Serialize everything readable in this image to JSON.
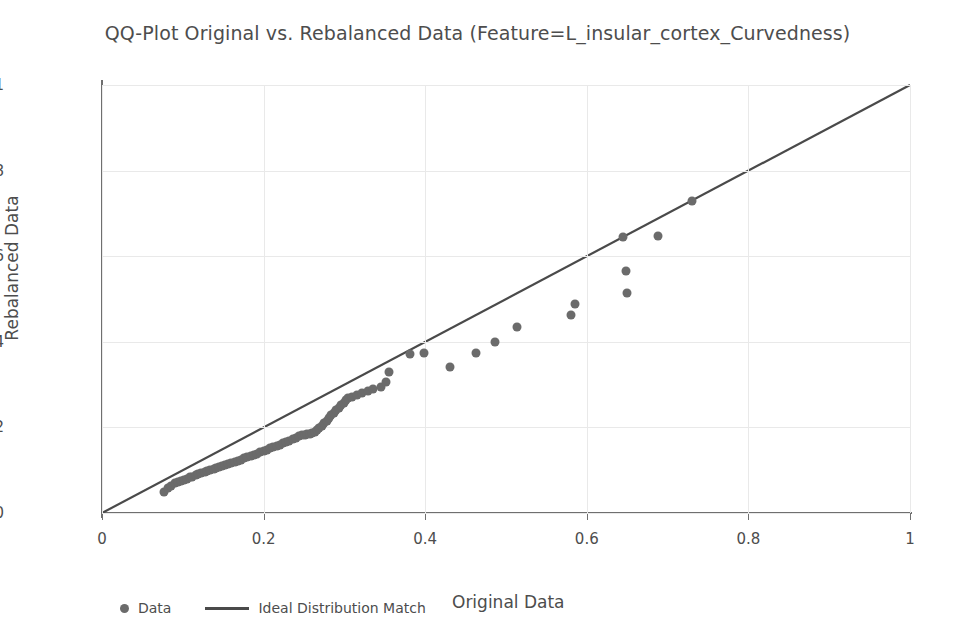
{
  "chart_data": {
    "type": "scatter",
    "title": "QQ-Plot Original vs. Rebalanced Data (Feature=L_insular_cortex_Curvedness)",
    "xlabel": "Original Data",
    "ylabel": "Rebalanced Data",
    "xlim": [
      0,
      1
    ],
    "ylim": [
      0,
      1
    ],
    "grid": true,
    "legend_position": "below-left",
    "xticks": [
      "0",
      "0.2",
      "0.4",
      "0.6",
      "0.8",
      "1"
    ],
    "xtick_values": [
      0,
      0.2,
      0.4,
      0.6,
      0.8,
      1
    ],
    "yticks": [
      "0",
      "0.2",
      "0.4",
      "0.6",
      "0.8",
      "1"
    ],
    "ytick_values": [
      0,
      0.2,
      0.4,
      0.6,
      0.8,
      1
    ],
    "series": [
      {
        "name": "Data",
        "type": "scatter",
        "color": "#6b6b6b",
        "marker": "circle",
        "points": [
          [
            0.077,
            0.05
          ],
          [
            0.082,
            0.058
          ],
          [
            0.086,
            0.064
          ],
          [
            0.09,
            0.069
          ],
          [
            0.094,
            0.072
          ],
          [
            0.098,
            0.075
          ],
          [
            0.101,
            0.078
          ],
          [
            0.105,
            0.08
          ],
          [
            0.109,
            0.083
          ],
          [
            0.112,
            0.085
          ],
          [
            0.116,
            0.088
          ],
          [
            0.119,
            0.09
          ],
          [
            0.123,
            0.093
          ],
          [
            0.127,
            0.095
          ],
          [
            0.13,
            0.098
          ],
          [
            0.134,
            0.1
          ],
          [
            0.138,
            0.103
          ],
          [
            0.141,
            0.105
          ],
          [
            0.145,
            0.108
          ],
          [
            0.149,
            0.11
          ],
          [
            0.152,
            0.112
          ],
          [
            0.156,
            0.115
          ],
          [
            0.16,
            0.117
          ],
          [
            0.164,
            0.12
          ],
          [
            0.168,
            0.122
          ],
          [
            0.172,
            0.125
          ],
          [
            0.176,
            0.128
          ],
          [
            0.18,
            0.13
          ],
          [
            0.184,
            0.133
          ],
          [
            0.188,
            0.136
          ],
          [
            0.192,
            0.139
          ],
          [
            0.196,
            0.142
          ],
          [
            0.2,
            0.145
          ],
          [
            0.204,
            0.148
          ],
          [
            0.208,
            0.151
          ],
          [
            0.212,
            0.154
          ],
          [
            0.216,
            0.157
          ],
          [
            0.22,
            0.16
          ],
          [
            0.224,
            0.163
          ],
          [
            0.228,
            0.166
          ],
          [
            0.232,
            0.169
          ],
          [
            0.236,
            0.172
          ],
          [
            0.24,
            0.176
          ],
          [
            0.244,
            0.179
          ],
          [
            0.248,
            0.182
          ],
          [
            0.251,
            0.183
          ],
          [
            0.254,
            0.184
          ],
          [
            0.257,
            0.185
          ],
          [
            0.26,
            0.187
          ],
          [
            0.263,
            0.19
          ],
          [
            0.266,
            0.194
          ],
          [
            0.269,
            0.199
          ],
          [
            0.272,
            0.204
          ],
          [
            0.275,
            0.21
          ],
          [
            0.278,
            0.216
          ],
          [
            0.281,
            0.222
          ],
          [
            0.284,
            0.228
          ],
          [
            0.287,
            0.234
          ],
          [
            0.29,
            0.24
          ],
          [
            0.293,
            0.246
          ],
          [
            0.296,
            0.252
          ],
          [
            0.299,
            0.258
          ],
          [
            0.302,
            0.264
          ],
          [
            0.305,
            0.268
          ],
          [
            0.31,
            0.272
          ],
          [
            0.316,
            0.276
          ],
          [
            0.322,
            0.281
          ],
          [
            0.329,
            0.286
          ],
          [
            0.336,
            0.29
          ],
          [
            0.345,
            0.294
          ],
          [
            0.352,
            0.305
          ],
          [
            0.355,
            0.33
          ],
          [
            0.381,
            0.372
          ],
          [
            0.398,
            0.373
          ],
          [
            0.431,
            0.34
          ],
          [
            0.463,
            0.375
          ],
          [
            0.487,
            0.4
          ],
          [
            0.513,
            0.435
          ],
          [
            0.58,
            0.463
          ],
          [
            0.585,
            0.488
          ],
          [
            0.645,
            0.645
          ],
          [
            0.648,
            0.565
          ],
          [
            0.65,
            0.515
          ],
          [
            0.688,
            0.648
          ],
          [
            0.73,
            0.73
          ]
        ]
      },
      {
        "name": "Ideal Distribution Match",
        "type": "line",
        "color": "#4a4a4a",
        "from": [
          0,
          0
        ],
        "to": [
          1,
          1
        ]
      }
    ]
  },
  "legend": {
    "data_label": "Data",
    "ideal_label": "Ideal Distribution Match"
  }
}
